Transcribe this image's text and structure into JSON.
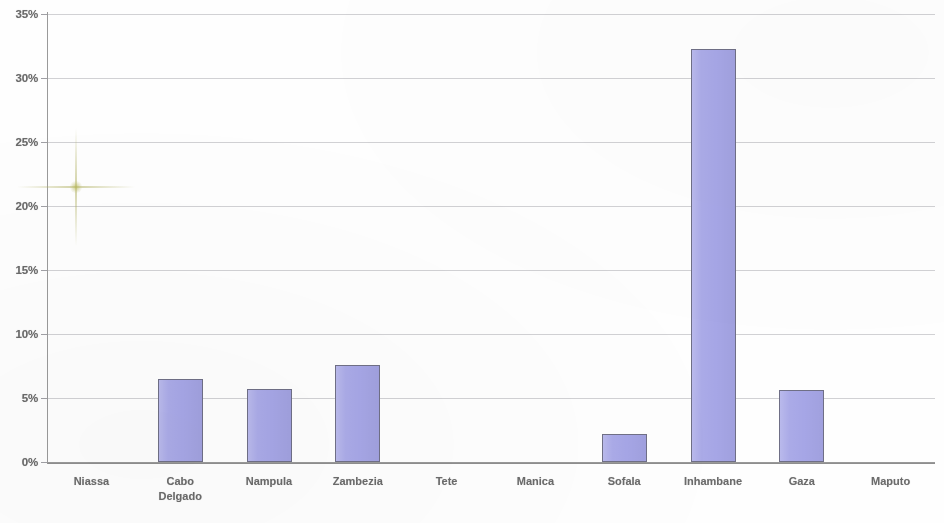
{
  "chart_data": {
    "type": "bar",
    "title": "",
    "subtitle": "",
    "xlabel": "",
    "ylabel": "",
    "categories": [
      "Niassa",
      "Cabo\nDelgado",
      "Nampula",
      "Zambezia",
      "Tete",
      "Manica",
      "Sofala",
      "Inhambane",
      "Gaza",
      "Maputo"
    ],
    "values": [
      0,
      6.5,
      5.7,
      7.6,
      0,
      0,
      2.2,
      32.3,
      5.6,
      0
    ],
    "ytick_labels": [
      "35%",
      "30%",
      "25%",
      "20%",
      "15%",
      "10%",
      "5%",
      "0%"
    ],
    "ytick_values": [
      35,
      30,
      25,
      20,
      15,
      10,
      5,
      0
    ],
    "ylim": [
      0,
      35
    ],
    "grid": true,
    "legend": null,
    "legend_position": "none",
    "bar_fill_color": "#a6a6e6",
    "bar_border_color": "#6f6f86",
    "gridline_color": "#b9b9bd",
    "axis_color": "#8e8e8e",
    "tick_label_color": "#4a4a4a"
  }
}
